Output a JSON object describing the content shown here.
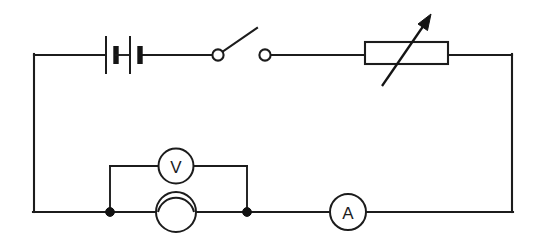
{
  "diagram": {
    "kind": "schematic",
    "background_color": "#ffffff",
    "line_color": "#1c1c1c",
    "canvas": {
      "width": 540,
      "height": 239
    }
  },
  "labels": {
    "voltmeter": "V",
    "ammeter": "A"
  },
  "components": [
    {
      "id": "battery",
      "name": "battery",
      "symbol": "battery-cells",
      "branch": "top-wire",
      "plates": 4,
      "label": ""
    },
    {
      "id": "switch",
      "name": "open-switch",
      "symbol": "switch-open",
      "branch": "top-wire",
      "state": "open",
      "label": ""
    },
    {
      "id": "variable-resistor",
      "name": "variable-resistor",
      "symbol": "rheostat-arrow",
      "branch": "top-wire",
      "label": ""
    },
    {
      "id": "voltmeter",
      "name": "voltmeter",
      "symbol": "circle-letter",
      "branch": "parallel-branch",
      "label": "V"
    },
    {
      "id": "lamp",
      "name": "lamp",
      "symbol": "circle-arc",
      "branch": "bottom-wire",
      "label": ""
    },
    {
      "id": "ammeter",
      "name": "ammeter",
      "symbol": "circle-letter",
      "branch": "bottom-wire",
      "label": "A"
    }
  ],
  "junctions": [
    {
      "id": "junction-left",
      "name": "junction-dot-left"
    },
    {
      "id": "junction-right",
      "name": "junction-dot-right"
    }
  ],
  "wires": {
    "outer_loop": "rectangular-loop",
    "parallel_branch": "voltmeter-branch"
  },
  "geometry": {
    "loop": {
      "left": 34,
      "right": 512,
      "top": 55,
      "bottom": 212
    },
    "battery": {
      "x_start": 105,
      "x_end": 142,
      "center_y": 55
    },
    "switch": {
      "left_terminal_x": 218,
      "right_terminal_x": 265,
      "lever_tip_x": 257,
      "lever_tip_y": 28
    },
    "variable_resistor": {
      "x": 365,
      "y": 42,
      "width": 83,
      "height": 22
    },
    "voltmeter_branch": {
      "left_x": 110,
      "right_x": 247,
      "top_y": 166
    },
    "voltmeter": {
      "cx": 176,
      "cy": 166,
      "r": 17
    },
    "lamp": {
      "cx": 176,
      "cy": 212,
      "r": 20
    },
    "ammeter": {
      "cx": 348,
      "cy": 212,
      "r": 18
    }
  }
}
